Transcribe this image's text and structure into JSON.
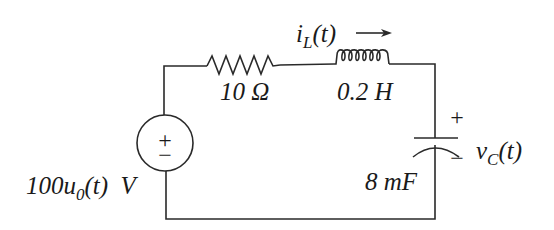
{
  "diagram": {
    "type": "series RLC circuit",
    "source": {
      "label_main": "100u",
      "label_sub": "0",
      "label_tail": "(t)  V",
      "full_label": "100u0(t) V",
      "polarity_plus": "+",
      "polarity_minus": "−"
    },
    "resistor": {
      "label": "10 Ω"
    },
    "inductor": {
      "label": "0.2 H",
      "current_main": "i",
      "current_sub": "L",
      "current_tail": "(t)",
      "current_full": "iL(t)",
      "current_direction": "right"
    },
    "capacitor": {
      "label": "8 mF",
      "voltage_main": "v",
      "voltage_sub": "C",
      "voltage_tail": "(t)",
      "voltage_full": "vC(t)",
      "polarity_plus": "+",
      "polarity_minus": "−"
    },
    "colors": {
      "line": "#2a2a2a",
      "text": "#1a1a1a",
      "background": "#ffffff"
    }
  }
}
